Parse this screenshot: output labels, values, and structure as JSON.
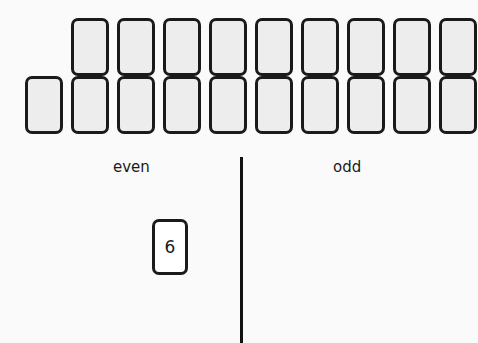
{
  "scene": {
    "background_color": "#fafafa",
    "ink_color": "#1a1a1a"
  },
  "deck": {
    "card_back_fill": "#ededed",
    "card_border_color": "#1a1a1a",
    "rows": [
      {
        "name": "top-row",
        "count": 9,
        "cards": [
          "",
          "",
          "",
          "",
          "",
          "",
          "",
          "",
          ""
        ]
      },
      {
        "name": "bottom-row",
        "count": 10,
        "cards": [
          "",
          "",
          "",
          "",
          "",
          "",
          "",
          "",
          "",
          ""
        ]
      }
    ],
    "total_face_down_cards": 19
  },
  "categories": {
    "left": {
      "label": "even"
    },
    "right": {
      "label": "odd"
    }
  },
  "divider": {
    "orientation": "vertical",
    "color": "#111111"
  },
  "played_card": {
    "value": "6",
    "side": "even",
    "face_up": true,
    "fill": "#ffffff"
  }
}
